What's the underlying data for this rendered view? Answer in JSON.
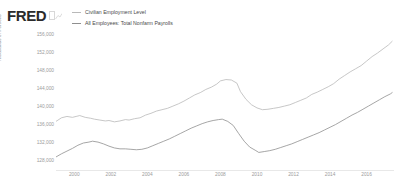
{
  "header": {
    "logo_text": "FRED",
    "logo_mark_name": "fred-chart-mark-icon"
  },
  "legend": {
    "position": "top-left",
    "entries": [
      {
        "label": "Civilian Employment Level",
        "color": "#b9b9b9"
      },
      {
        "label": "All Employees: Total Nonfarm Payrolls",
        "color": "#8f8f8f"
      }
    ]
  },
  "chart_data": {
    "type": "line",
    "title": "",
    "subtitle": "",
    "xlabel": "",
    "ylabel": "Thousands of Persons",
    "grid": false,
    "legend_position": "top-left",
    "xlim": [
      1999.0,
      2017.5
    ],
    "ylim": [
      126000,
      158000
    ],
    "xticks": [
      2000,
      2002,
      2004,
      2006,
      2008,
      2010,
      2012,
      2014,
      2016
    ],
    "xticklabels": [
      "2000",
      "2002",
      "2004",
      "2006",
      "2008",
      "2010",
      "2012",
      "2014",
      "2016"
    ],
    "yticks": [
      128000,
      132000,
      136000,
      140000,
      144000,
      148000,
      152000,
      156000
    ],
    "yticklabels": [
      "128,000",
      "132,000",
      "136,000",
      "140,000",
      "144,000",
      "148,000",
      "152,000",
      "156,000"
    ],
    "series": [
      {
        "name": "Civilian Employment Level",
        "color": "#b9b9b9",
        "x": [
          1999.0,
          1999.3,
          1999.6,
          1999.9,
          2000.1,
          2000.3,
          2000.6,
          2000.9,
          2001.1,
          2001.4,
          2001.7,
          2001.9,
          2002.2,
          2002.5,
          2002.8,
          2003.0,
          2003.3,
          2003.6,
          2003.9,
          2004.2,
          2004.5,
          2004.8,
          2005.1,
          2005.4,
          2005.7,
          2006.0,
          2006.3,
          2006.6,
          2006.9,
          2007.2,
          2007.5,
          2007.8,
          2008.0,
          2008.3,
          2008.6,
          2008.9,
          2009.1,
          2009.4,
          2009.7,
          2010.0,
          2010.3,
          2010.6,
          2010.9,
          2011.2,
          2011.5,
          2011.8,
          2012.1,
          2012.4,
          2012.7,
          2013.0,
          2013.3,
          2013.6,
          2013.9,
          2014.2,
          2014.5,
          2014.8,
          2015.1,
          2015.4,
          2015.7,
          2016.0,
          2016.3,
          2016.6,
          2016.9,
          2017.2,
          2017.4
        ],
        "y": [
          136800,
          137600,
          137900,
          137700,
          137900,
          138100,
          137700,
          137500,
          137300,
          137100,
          136900,
          137000,
          136700,
          136900,
          137200,
          137100,
          137400,
          137600,
          138200,
          138600,
          139100,
          139400,
          139700,
          140200,
          140700,
          141300,
          142000,
          142700,
          143200,
          143900,
          144400,
          145100,
          145800,
          146100,
          146000,
          145300,
          143400,
          141700,
          140500,
          139800,
          139400,
          139500,
          139700,
          139900,
          140200,
          140500,
          141000,
          141500,
          142000,
          142800,
          143300,
          143900,
          144500,
          145200,
          146200,
          147000,
          147800,
          148500,
          149200,
          150200,
          151200,
          152000,
          152900,
          153800,
          154600
        ]
      },
      {
        "name": "All Employees: Total Nonfarm Payrolls",
        "color": "#8f8f8f",
        "x": [
          1999.0,
          1999.3,
          1999.6,
          1999.9,
          2000.2,
          2000.5,
          2000.8,
          2001.0,
          2001.3,
          2001.6,
          2001.9,
          2002.2,
          2002.5,
          2002.8,
          2003.1,
          2003.4,
          2003.7,
          2004.0,
          2004.3,
          2004.6,
          2004.9,
          2005.2,
          2005.5,
          2005.8,
          2006.1,
          2006.4,
          2006.7,
          2007.0,
          2007.3,
          2007.6,
          2007.9,
          2008.1,
          2008.4,
          2008.7,
          2009.0,
          2009.3,
          2009.6,
          2009.9,
          2010.1,
          2010.4,
          2010.7,
          2011.0,
          2011.3,
          2011.6,
          2011.9,
          2012.2,
          2012.5,
          2012.8,
          2013.1,
          2013.4,
          2013.7,
          2014.0,
          2014.3,
          2014.6,
          2014.9,
          2015.2,
          2015.5,
          2015.8,
          2016.1,
          2016.4,
          2016.7,
          2017.0,
          2017.3,
          2017.4
        ],
        "y": [
          128900,
          129600,
          130200,
          130800,
          131500,
          132000,
          132200,
          132400,
          132200,
          131800,
          131300,
          130900,
          130700,
          130700,
          130600,
          130500,
          130600,
          130900,
          131400,
          131900,
          132400,
          132900,
          133500,
          134100,
          134700,
          135300,
          135800,
          136300,
          136700,
          137000,
          137200,
          137300,
          136800,
          135900,
          134100,
          132400,
          131100,
          130400,
          129900,
          130100,
          130300,
          130600,
          131000,
          131400,
          131800,
          132300,
          132800,
          133300,
          133800,
          134300,
          134900,
          135500,
          136100,
          136800,
          137500,
          138200,
          138800,
          139500,
          140200,
          140900,
          141600,
          142300,
          142900,
          143200
        ]
      }
    ]
  }
}
